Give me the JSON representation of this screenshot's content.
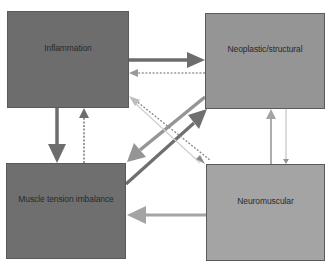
{
  "diagram": {
    "nodes": [
      {
        "id": "inflammation",
        "label": "Inflammation",
        "color": "#6d6d6d"
      },
      {
        "id": "neoplastic",
        "label": "Neoplastic/structural",
        "color": "#959595"
      },
      {
        "id": "muscle",
        "label": "Muscle tension imbalance",
        "color": "#6f6f6f"
      },
      {
        "id": "neuro",
        "label": "Neuromuscular",
        "color": "#a4a4a4"
      }
    ],
    "edges": [
      {
        "from": "inflammation",
        "to": "neoplastic",
        "style": "solid-thick",
        "color": "#6d6d6d"
      },
      {
        "from": "neoplastic",
        "to": "inflammation",
        "style": "dotted",
        "color": "#959595"
      },
      {
        "from": "inflammation",
        "to": "muscle",
        "style": "solid-thick",
        "color": "#6d6d6d"
      },
      {
        "from": "muscle",
        "to": "inflammation",
        "style": "dotted",
        "color": "#6f6f6f"
      },
      {
        "from": "neoplastic",
        "to": "muscle",
        "style": "solid-thick",
        "color": "#959595"
      },
      {
        "from": "muscle",
        "to": "neoplastic",
        "style": "solid-thick",
        "color": "#6f6f6f"
      },
      {
        "from": "inflammation",
        "to": "neuro",
        "style": "dotted",
        "color": "#8a8a8a"
      },
      {
        "from": "neuro",
        "to": "inflammation",
        "style": "solid-thin",
        "color": "#c8c8c8"
      },
      {
        "from": "neuro",
        "to": "neoplastic",
        "style": "solid",
        "color": "#a4a4a4"
      },
      {
        "from": "neoplastic",
        "to": "neuro",
        "style": "solid-thin",
        "color": "#959595"
      },
      {
        "from": "neuro",
        "to": "muscle",
        "style": "solid-thick",
        "color": "#a4a4a4"
      }
    ]
  }
}
